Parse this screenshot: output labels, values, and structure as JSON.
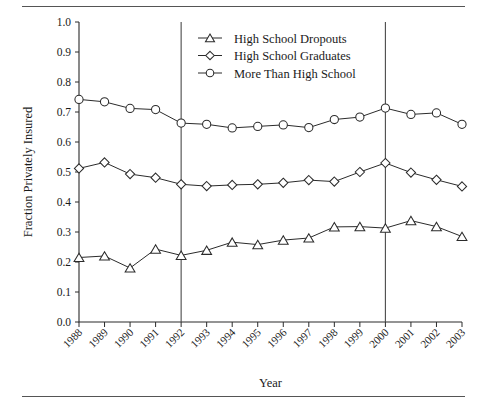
{
  "figure": {
    "has_top_rule": true,
    "has_bottom_rule": true,
    "background_color": "#ffffff",
    "line_color": "#2b2b2b"
  },
  "chart_data": {
    "type": "line",
    "title": "",
    "xlabel": "Year",
    "ylabel": "Fraction Privately Insured",
    "x": [
      1988,
      1989,
      1990,
      1991,
      1992,
      1993,
      1994,
      1995,
      1996,
      1997,
      1998,
      1999,
      2000,
      2001,
      2002,
      2003
    ],
    "categories": [
      "1988",
      "1989",
      "1990",
      "1991",
      "1992",
      "1993",
      "1994",
      "1995",
      "1996",
      "1997",
      "1998",
      "1999",
      "2000",
      "2001",
      "2002",
      "2003"
    ],
    "xlim": [
      1988,
      2003
    ],
    "ylim": [
      0.0,
      1.0
    ],
    "ytick_values": [
      0.0,
      0.1,
      0.2,
      0.3,
      0.4,
      0.5,
      0.6,
      0.7,
      0.8,
      0.9,
      1.0
    ],
    "ytick_labels": [
      "0.0",
      "0.1",
      "0.2",
      "0.3",
      "0.4",
      "0.5",
      "0.6",
      "0.7",
      "0.8",
      "0.9",
      "1.0"
    ],
    "grid": false,
    "legend_position": "top-center",
    "reference_lines": [
      {
        "x": 1992,
        "orientation": "vertical"
      },
      {
        "x": 2000,
        "orientation": "vertical"
      }
    ],
    "series": [
      {
        "name": "High  School Dropouts",
        "marker": "triangle",
        "values": [
          0.215,
          0.22,
          0.18,
          0.243,
          0.222,
          0.239,
          0.266,
          0.258,
          0.273,
          0.28,
          0.317,
          0.318,
          0.313,
          0.338,
          0.318,
          0.285
        ]
      },
      {
        "name": "High School Graduates",
        "marker": "diamond",
        "values": [
          0.512,
          0.532,
          0.493,
          0.481,
          0.459,
          0.453,
          0.457,
          0.459,
          0.464,
          0.473,
          0.468,
          0.5,
          0.53,
          0.498,
          0.474,
          0.452
        ]
      },
      {
        "name": "More Than High School",
        "marker": "circle",
        "values": [
          0.742,
          0.734,
          0.712,
          0.708,
          0.663,
          0.659,
          0.647,
          0.652,
          0.657,
          0.648,
          0.675,
          0.683,
          0.713,
          0.692,
          0.697,
          0.659
        ]
      }
    ]
  }
}
